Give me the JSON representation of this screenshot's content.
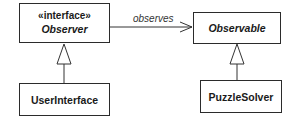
{
  "diagram": {
    "type": "uml-class",
    "classes": [
      {
        "id": "observer",
        "stereotype": "«interface»",
        "name": "Observer",
        "abstract": true
      },
      {
        "id": "observable",
        "name": "Observable",
        "abstract": true
      },
      {
        "id": "userinterface",
        "name": "UserInterface",
        "abstract": false
      },
      {
        "id": "puzzlesolver",
        "name": "PuzzleSolver",
        "abstract": false
      }
    ],
    "relations": [
      {
        "from": "observer",
        "to": "observable",
        "kind": "association",
        "label": "observes"
      },
      {
        "from": "userinterface",
        "to": "observer",
        "kind": "realization"
      },
      {
        "from": "puzzlesolver",
        "to": "observable",
        "kind": "generalization"
      }
    ]
  }
}
